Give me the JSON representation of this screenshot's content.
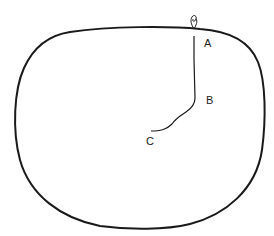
{
  "diagram": {
    "colors": {
      "stroke": "#1a1a1a",
      "background": "#ffffff"
    },
    "labels": [
      {
        "id": "A",
        "text": "A",
        "x": 204,
        "y": 47
      },
      {
        "id": "B",
        "text": "B",
        "x": 206,
        "y": 104
      },
      {
        "id": "C",
        "text": "C",
        "x": 146,
        "y": 145
      }
    ]
  }
}
